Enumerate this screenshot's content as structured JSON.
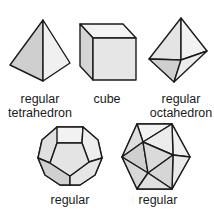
{
  "figure": {
    "solids": [
      {
        "id": "tetrahedron",
        "label_line1": "regular",
        "label_line2": "tetrahedron"
      },
      {
        "id": "cube",
        "label_line1": "cube",
        "label_line2": ""
      },
      {
        "id": "octahedron",
        "label_line1": "regular",
        "label_line2": "octahedron"
      },
      {
        "id": "dodecahedron",
        "label_line1": "regular",
        "label_line2": ""
      },
      {
        "id": "icosahedron",
        "label_line1": "regular",
        "label_line2": ""
      }
    ],
    "colors": {
      "stroke": "#1a1a1a",
      "face_light": "#f0f0f0",
      "face_mid": "#e2e2e2",
      "face_dark": "#cfcfcf"
    }
  }
}
